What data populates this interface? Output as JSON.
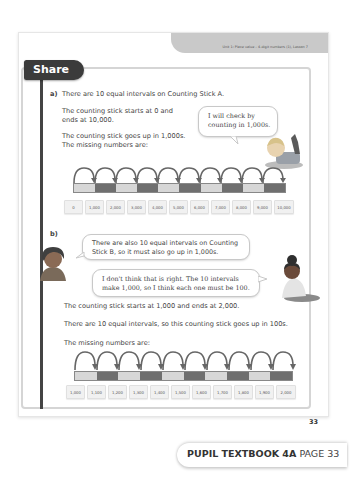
{
  "header": {
    "unit_label": "Unit 1: Place value – 4-digit numbers (1), Lesson 7"
  },
  "section": {
    "title": "Share"
  },
  "part_a": {
    "marker": "a)",
    "intro": "There are 10 equal intervals on Counting Stick A.",
    "line1a": "The counting stick starts at 0 and",
    "line1b": "ends at 10,000.",
    "line2a": "The counting stick goes up in 1,000s.",
    "line2b": "The missing numbers are:",
    "bubble_line1": "I will check by",
    "bubble_line2": "counting in 1,000s.",
    "stick_segments": 10,
    "labels": [
      "0",
      "1,000",
      "2,000",
      "3,000",
      "4,000",
      "5,000",
      "6,000",
      "7,000",
      "8,000",
      "9,000",
      "10,000"
    ]
  },
  "part_b": {
    "marker": "b)",
    "bubble1_line1": "There are also 10 equal intervals on Counting",
    "bubble1_line2": "Stick B, so it must also go up in 1,000s.",
    "bubble2_line1": "I don't think that is right. The 10 intervals",
    "bubble2_line2": "make 1,000, so I think each one must be 100.",
    "line1": "The counting stick starts at 1,000 and ends at 2,000.",
    "line2": "There are 10 equal intervals, so this counting stick goes up in 100s.",
    "line3": "The missing numbers are:",
    "stick_segments": 10,
    "labels": [
      "1,000",
      "1,100",
      "1,200",
      "1,300",
      "1,400",
      "1,500",
      "1,600",
      "1,700",
      "1,800",
      "1,900",
      "2,000"
    ]
  },
  "page_number": "33",
  "footer": {
    "book": "PUPIL TEXTBOOK 4A",
    "page": "PAGE 33"
  },
  "colors": {
    "share_tab": "#3b3b3b",
    "stick_light": "#d7d7d7",
    "stick_dark": "#6f6f6f",
    "unit_tab": "#c9c9c9"
  }
}
